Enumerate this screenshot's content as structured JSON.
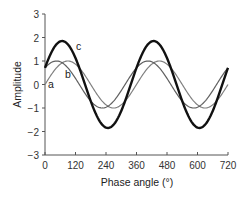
{
  "chart_data": {
    "type": "line",
    "title": "",
    "xlabel": "Phase angle (°)",
    "ylabel": "Amplitude",
    "xlim": [
      0,
      720
    ],
    "ylim": [
      -3,
      3
    ],
    "xticks": [
      0,
      120,
      240,
      360,
      480,
      600,
      720
    ],
    "yticks": [
      -3,
      -2,
      -1,
      0,
      1,
      2,
      3
    ],
    "grid": false,
    "legend": "curve labels a, b, c placed near curves",
    "series": [
      {
        "name": "a",
        "label": "a",
        "formula": "sin(x)",
        "amplitude": 1,
        "phase_deg": 0,
        "color": "#777777",
        "linewidth": 1.2,
        "x": [
          0,
          90,
          180,
          270,
          360,
          450,
          540,
          630,
          720
        ],
        "values": [
          0,
          1,
          0,
          -1,
          0,
          1,
          0,
          -1,
          0
        ]
      },
      {
        "name": "b",
        "label": "b",
        "formula": "sin(x+45)",
        "amplitude": 1,
        "phase_deg": 45,
        "color": "#555555",
        "linewidth": 1.2,
        "x": [
          0,
          45,
          135,
          225,
          315,
          405,
          495,
          585,
          675,
          720
        ],
        "values": [
          0.71,
          1,
          0,
          -1,
          0,
          1,
          0,
          -1,
          0,
          0.71
        ]
      },
      {
        "name": "c",
        "label": "c",
        "formula": "a + b",
        "amplitude": 1.85,
        "phase_deg": 22.5,
        "color": "#111111",
        "linewidth": 2.4,
        "x": [
          0,
          67.5,
          157.5,
          247.5,
          337.5,
          427.5,
          517.5,
          607.5,
          697.5,
          720
        ],
        "values": [
          0.71,
          1.85,
          0,
          -1.85,
          0,
          1.85,
          0,
          -1.85,
          0,
          0.71
        ]
      }
    ]
  },
  "labels": {
    "a": "a",
    "b": "b",
    "c": "c",
    "xlabel": "Phase angle (°)",
    "ylabel": "Amplitude"
  },
  "ticks": {
    "x": [
      "0",
      "120",
      "240",
      "360",
      "480",
      "600",
      "720"
    ],
    "y": [
      "3",
      "2",
      "1",
      "0",
      "−1",
      "−2",
      "−3"
    ]
  }
}
